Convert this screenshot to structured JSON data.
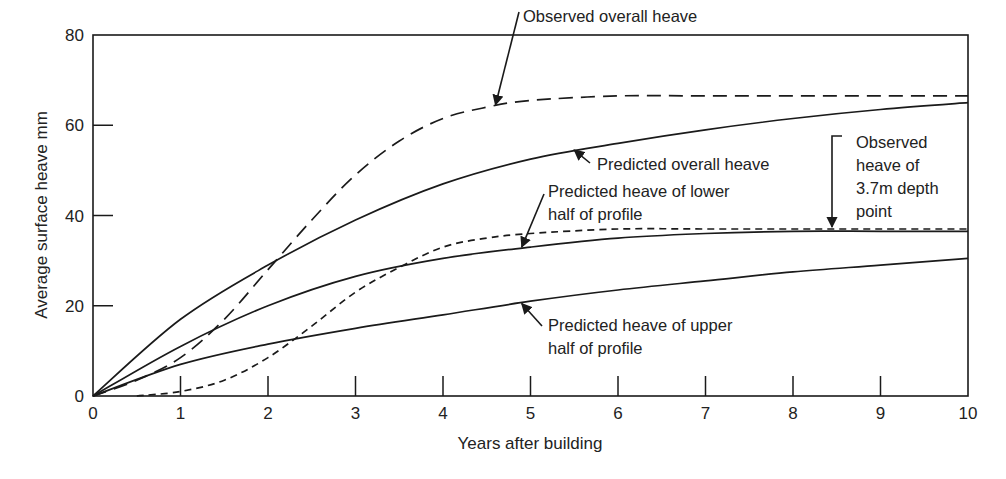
{
  "chart_data": {
    "type": "line",
    "title": "",
    "xlabel": "Years after building",
    "ylabel": "Average surface heave mm",
    "xlim": [
      0,
      10
    ],
    "ylim": [
      0,
      80
    ],
    "xticks": [
      0,
      1,
      2,
      3,
      4,
      5,
      6,
      7,
      8,
      9,
      10
    ],
    "yticks": [
      0,
      20,
      40,
      60,
      80
    ],
    "grid": false,
    "legend": "none (curves labelled by in-plot annotations with arrows)",
    "series": [
      {
        "name": "Observed overall heave",
        "style": "long-dash",
        "x": [
          0,
          0.5,
          1,
          1.5,
          2,
          2.5,
          3,
          3.5,
          4,
          4.5,
          5,
          6,
          7,
          8,
          9,
          10
        ],
        "y": [
          0,
          3.5,
          8.5,
          17,
          28,
          39,
          49,
          56.5,
          61.5,
          64,
          65.5,
          66.5,
          66.5,
          66.5,
          66.5,
          66.5
        ]
      },
      {
        "name": "Predicted overall heave",
        "style": "solid",
        "x": [
          0,
          1,
          2,
          3,
          4,
          5,
          6,
          7,
          8,
          9,
          10
        ],
        "y": [
          0,
          17,
          29,
          39,
          47,
          52.5,
          56,
          59,
          61.5,
          63.5,
          65
        ]
      },
      {
        "name": "Predicted heave of lower half of profile",
        "style": "solid",
        "x": [
          0,
          1,
          2,
          3,
          4,
          5,
          6,
          7,
          8,
          9,
          10
        ],
        "y": [
          0,
          11,
          20,
          26.5,
          30.5,
          33,
          35,
          36,
          36.5,
          36.5,
          36.5
        ]
      },
      {
        "name": "Observed heave of 3.7m depth point",
        "style": "short-dash",
        "x": [
          0.5,
          1,
          1.5,
          2,
          2.5,
          3,
          3.5,
          4,
          4.5,
          5,
          6,
          7,
          8,
          9,
          10
        ],
        "y": [
          0,
          1,
          3.5,
          8.5,
          15.5,
          23,
          28.5,
          33,
          35,
          36,
          37,
          37,
          37,
          37,
          37
        ]
      },
      {
        "name": "Predicted heave of upper half of profile",
        "style": "solid",
        "x": [
          0,
          1,
          2,
          3,
          4,
          5,
          6,
          7,
          8,
          9,
          10
        ],
        "y": [
          0,
          7,
          11.5,
          15,
          18,
          21,
          23.5,
          25.5,
          27.5,
          29,
          30.5
        ]
      }
    ],
    "annotations": [
      {
        "lines": [
          "Observed overall heave"
        ],
        "target_series": 0,
        "arrow_to": [
          4.6,
          64.5
        ]
      },
      {
        "lines": [
          "Predicted overall heave"
        ],
        "target_series": 1,
        "arrow_to": [
          5.5,
          54.5
        ]
      },
      {
        "lines": [
          "Predicted heave of lower",
          "half of profile"
        ],
        "target_series": 2,
        "arrow_to": [
          4.9,
          33
        ]
      },
      {
        "lines": [
          "Observed",
          "heave of",
          "3.7m depth",
          "point"
        ],
        "target_series": 3,
        "arrow_to": [
          8.4,
          37
        ]
      },
      {
        "lines": [
          "Predicted heave of upper",
          "half of profile"
        ],
        "target_series": 4,
        "arrow_to": [
          4.9,
          20.5
        ]
      }
    ]
  },
  "colors": {
    "line": "#1a1a1a",
    "text": "#222222",
    "background": "#ffffff"
  }
}
